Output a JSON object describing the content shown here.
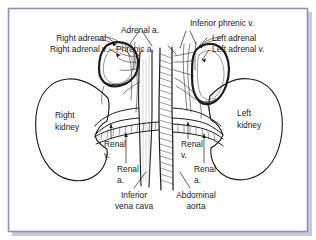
{
  "figure": {
    "type": "anatomical-diagram",
    "frame_color": "#8f8fc0",
    "background_color": "#ffffff",
    "ink_color": "#1a1a1a"
  },
  "labels": {
    "right_adrenal": "Right adrenal",
    "right_adrenal_v": "Right adrenal v.",
    "adrenal_a": "Adrenal a.",
    "phrenic_a": "Phrenic a.",
    "inferior_phrenic_v": "Inferior phrenic v.",
    "left_adrenal": "Left adrenal",
    "left_adrenal_v": "Left adrenal v.",
    "right_kidney_l1": "Right",
    "right_kidney_l2": "kidney",
    "left_kidney_l1": "Left",
    "left_kidney_l2": "kidney",
    "renal_v_left_l1": "Renal",
    "renal_v_left_l2": "v.",
    "renal_a_left_l1": "Renal",
    "renal_a_left_l2": "a.",
    "renal_v_right_l1": "Renal",
    "renal_v_right_l2": "v.",
    "renal_a_right_l1": "Renal",
    "renal_a_right_l2": "a.",
    "inferior_vena_cava_l1": "Inferior",
    "inferior_vena_cava_l2": "vena cava",
    "abdominal_aorta_l1": "Abdominal",
    "abdominal_aorta_l2": "aorta"
  },
  "structures": {
    "right_kidney": "bean-shaped organ, left side of image",
    "left_kidney": "bean-shaped organ, right side of image",
    "right_adrenal": "triangular pyramidal gland atop right kidney",
    "left_adrenal": "elongated crescent gland atop left kidney",
    "inferior_vena_cava": "large vertical vein, right of midline (image left of aorta is IVC side)",
    "abdominal_aorta": "large vertical hatched artery at midline",
    "renal_veins": "horizontal vessels entering kidney hila",
    "renal_arteries": "hatched horizontal vessels below renal veins"
  }
}
